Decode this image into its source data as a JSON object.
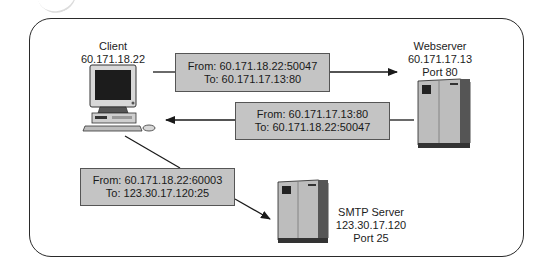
{
  "nodes": {
    "client": {
      "name": "Client",
      "ip": "60.171.18.22"
    },
    "webserver": {
      "name": "Webserver",
      "ip": "60.171.17.13",
      "port": "Port 80"
    },
    "smtp": {
      "name": "SMTP Server",
      "ip": "123.30.17.120",
      "port": "Port 25"
    }
  },
  "packets": [
    {
      "from": "From: 60.171.18.22:50047",
      "to": "To: 60.171.17.13:80",
      "direction": "client-to-webserver"
    },
    {
      "from": "From: 60.171.17.13:80",
      "to": "To: 60.171.18.22:50047",
      "direction": "webserver-to-client"
    },
    {
      "from": "From: 60.171.18.22:60003",
      "to": "To: 123.30.17.120:25",
      "direction": "client-to-smtp"
    }
  ],
  "colors": {
    "packet_fill": "#c4c4c4",
    "stroke": "#2a2a2a",
    "background": "#ffffff"
  }
}
